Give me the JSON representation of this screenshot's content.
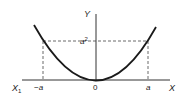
{
  "diagram": {
    "type": "parabola",
    "equation": "Y = X^2",
    "labels": {
      "y_axis": "Y",
      "x_axis": "X",
      "x_axis_left": "X",
      "x_axis_left_sub": "1",
      "neg_a": "−a",
      "origin": "0",
      "pos_a": "a",
      "a_squared": "a",
      "a_squared_sup": "2"
    },
    "colors": {
      "curve": "#1a1a1a",
      "axes": "#333333",
      "dashed": "#444444",
      "background": "#ffffff"
    }
  }
}
